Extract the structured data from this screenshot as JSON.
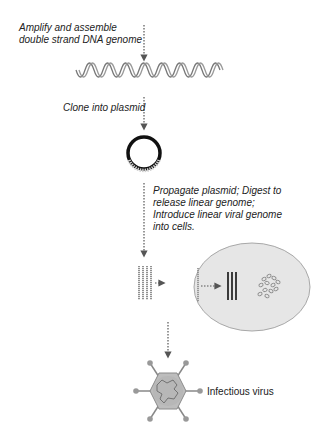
{
  "diagram": {
    "steps": [
      {
        "id": "amplify",
        "label_line1": "Amplify and assemble",
        "label_line2": "double strand DNA genome"
      },
      {
        "id": "clone",
        "label": "Clone into plasmid"
      },
      {
        "id": "propagate",
        "label_line1": "Propagate plasmid; Digest to",
        "label_line2": "release linear genome;",
        "label_line3": "Introduce linear viral genome",
        "label_line4": "into cells."
      },
      {
        "id": "virus",
        "label": "Infectious virus"
      }
    ],
    "nodes": [
      "dsDNA helix",
      "circular plasmid",
      "linear genome strands",
      "cell with replicating genome",
      "infectious virus particle"
    ],
    "colors": {
      "arrow": "#555555",
      "cell_fill": "#e6e6e6",
      "cell_stroke": "#a8a8a8",
      "plasmid": "#111111",
      "virus_fill": "#b8b8b8"
    }
  }
}
